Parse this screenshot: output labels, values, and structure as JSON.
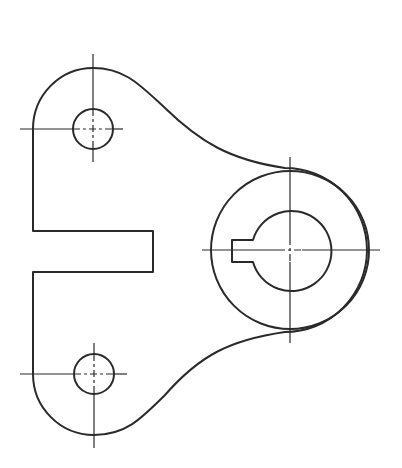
{
  "drawing": {
    "type": "mechanical-part-outline",
    "description": "Lever/bracket plate with two mounting holes and a keyed hub bore",
    "colors": {
      "line": "#2a2a2a",
      "background": "#ffffff"
    },
    "features": {
      "top_hole": {
        "cx": 93,
        "cy": 129,
        "r": 20
      },
      "bottom_hole": {
        "cx": 94,
        "cy": 374,
        "r": 20
      },
      "hub_outer": {
        "cx": 290,
        "cy": 250,
        "r": 79
      },
      "hub_bore": {
        "cx": 290,
        "cy": 250,
        "r": 40
      },
      "keyway": {
        "x1": 232,
        "y1": 240,
        "x2": 253,
        "y2": 262
      },
      "slot": {
        "x1": 33,
        "y1": 231,
        "x2": 153,
        "y2": 272
      }
    }
  }
}
